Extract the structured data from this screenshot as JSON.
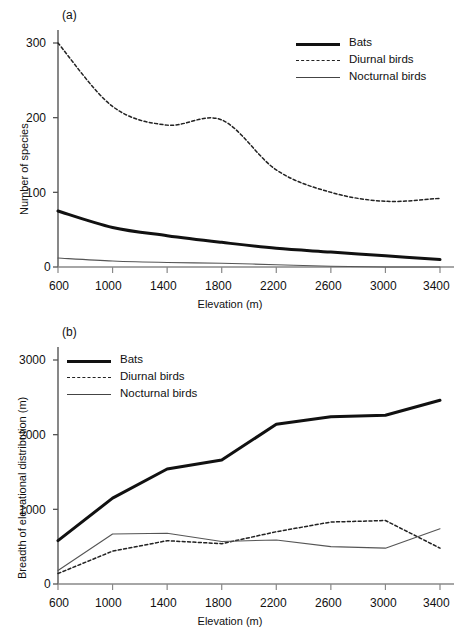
{
  "figure": {
    "panels": [
      {
        "tag": "(a)",
        "ylabel": "Number of species",
        "xlabel": "Elevation (m)"
      },
      {
        "tag": "(b)",
        "ylabel": "Breadth of elevational distribution (m)",
        "xlabel": "Elevation (m)"
      }
    ],
    "legend": [
      {
        "label": "Bats",
        "style": "thick-solid",
        "color": "#111111"
      },
      {
        "label": "Diurnal birds",
        "style": "dashed",
        "color": "#222222"
      },
      {
        "label": "Nocturnal birds",
        "style": "thin-solid",
        "color": "#444444"
      }
    ]
  },
  "chart_data": [
    {
      "type": "line",
      "title": "(a)",
      "xlabel": "Elevation (m)",
      "ylabel": "Number of species",
      "x": [
        600,
        1000,
        1400,
        1800,
        2200,
        2600,
        3000,
        3400
      ],
      "xlim": [
        600,
        3400
      ],
      "ylim": [
        0,
        320
      ],
      "yticks": [
        0,
        100,
        200,
        300
      ],
      "xticks": [
        600,
        1000,
        1400,
        1800,
        2200,
        2600,
        3000,
        3400
      ],
      "grid": false,
      "legend_position": "top-right",
      "series": [
        {
          "name": "Bats",
          "values": [
            75,
            53,
            42,
            33,
            25,
            20,
            15,
            10
          ]
        },
        {
          "name": "Diurnal birds",
          "values": [
            300,
            215,
            190,
            197,
            130,
            100,
            88,
            92
          ]
        },
        {
          "name": "Nocturnal birds",
          "values": [
            12,
            8,
            6,
            5,
            3,
            1,
            0,
            0
          ]
        }
      ]
    },
    {
      "type": "line",
      "title": "(b)",
      "xlabel": "Elevation (m)",
      "ylabel": "Breadth of elevational distribution (m)",
      "x": [
        600,
        1000,
        1400,
        1800,
        2200,
        2600,
        3000,
        3400
      ],
      "xlim": [
        600,
        3400
      ],
      "ylim": [
        0,
        3200
      ],
      "yticks": [
        0,
        1000,
        2000,
        3000
      ],
      "xticks": [
        600,
        1000,
        1400,
        1800,
        2200,
        2600,
        3000,
        3400
      ],
      "grid": false,
      "legend_position": "top-left",
      "series": [
        {
          "name": "Bats",
          "values": [
            580,
            1150,
            1540,
            1660,
            2140,
            2240,
            2260,
            2460
          ]
        },
        {
          "name": "Diurnal birds",
          "values": [
            140,
            440,
            580,
            540,
            700,
            830,
            850,
            480
          ]
        },
        {
          "name": "Nocturnal birds",
          "values": [
            180,
            670,
            680,
            570,
            590,
            500,
            480,
            740
          ]
        }
      ]
    }
  ],
  "ticks": {
    "panel_a_y": [
      "300",
      "200",
      "100",
      "0"
    ],
    "panel_b_y": [
      "3000",
      "2000",
      "1000",
      "0"
    ],
    "x": [
      "600",
      "1000",
      "1400",
      "1800",
      "2200",
      "2600",
      "3000",
      "3400"
    ]
  }
}
